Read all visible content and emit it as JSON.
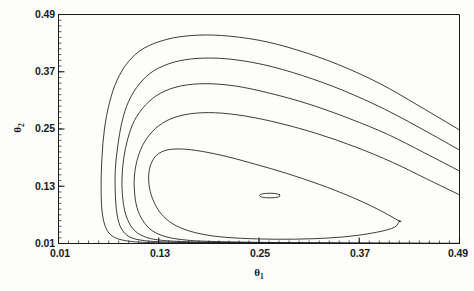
{
  "figure": {
    "type": "contour-plot",
    "background_color": "#fdfdfc",
    "line_color": "#1a1a1a",
    "axis_color": "#1a1a1a"
  },
  "axes": {
    "x": {
      "title_base": "θ",
      "title_sub": "1",
      "ticks": [
        "0.01",
        "0.13",
        "0.25",
        "0.37",
        "0.49"
      ],
      "min": 0.01,
      "max": 0.49
    },
    "y": {
      "title_base": "θ",
      "title_sub": "2",
      "ticks": [
        "0.01",
        "0.13",
        "0.25",
        "0.37",
        "0.49"
      ],
      "min": 0.01,
      "max": 0.49
    }
  },
  "chart_data": {
    "type": "line",
    "title": "",
    "xlabel": "θ₁",
    "ylabel": "θ₂",
    "xlim": [
      0.01,
      0.49
    ],
    "ylim": [
      0.01,
      0.49
    ],
    "xticks": [
      0.01,
      0.13,
      0.25,
      0.37,
      0.49
    ],
    "yticks": [
      0.01,
      0.13,
      0.25,
      0.37,
      0.49
    ],
    "grid": false,
    "legend": "none",
    "maximum_point": [
      0.26,
      0.11
    ],
    "series": [
      {
        "name": "contour-level-1-outermost",
        "closed": false,
        "points": [
          [
            0.49,
            0.248
          ],
          [
            0.44,
            0.3
          ],
          [
            0.395,
            0.345
          ],
          [
            0.345,
            0.385
          ],
          [
            0.295,
            0.416
          ],
          [
            0.25,
            0.436
          ],
          [
            0.205,
            0.446
          ],
          [
            0.17,
            0.446
          ],
          [
            0.14,
            0.438
          ],
          [
            0.113,
            0.42
          ],
          [
            0.094,
            0.392
          ],
          [
            0.08,
            0.352
          ],
          [
            0.071,
            0.305
          ],
          [
            0.065,
            0.25
          ],
          [
            0.062,
            0.19
          ],
          [
            0.061,
            0.13
          ],
          [
            0.062,
            0.08
          ],
          [
            0.066,
            0.046
          ],
          [
            0.074,
            0.026
          ],
          [
            0.09,
            0.016
          ],
          [
            0.12,
            0.012
          ],
          [
            0.18,
            0.011
          ],
          [
            0.26,
            0.0105
          ],
          [
            0.35,
            0.0103
          ],
          [
            0.43,
            0.0102
          ],
          [
            0.49,
            0.0101
          ]
        ]
      },
      {
        "name": "contour-level-2",
        "closed": false,
        "points": [
          [
            0.49,
            0.206
          ],
          [
            0.445,
            0.25
          ],
          [
            0.4,
            0.292
          ],
          [
            0.352,
            0.33
          ],
          [
            0.302,
            0.362
          ],
          [
            0.255,
            0.385
          ],
          [
            0.212,
            0.397
          ],
          [
            0.177,
            0.398
          ],
          [
            0.148,
            0.39
          ],
          [
            0.124,
            0.372
          ],
          [
            0.107,
            0.345
          ],
          [
            0.094,
            0.308
          ],
          [
            0.086,
            0.265
          ],
          [
            0.081,
            0.215
          ],
          [
            0.078,
            0.165
          ],
          [
            0.078,
            0.115
          ],
          [
            0.08,
            0.072
          ],
          [
            0.085,
            0.042
          ],
          [
            0.095,
            0.024
          ],
          [
            0.113,
            0.016
          ],
          [
            0.145,
            0.0128
          ],
          [
            0.2,
            0.0115
          ],
          [
            0.28,
            0.0108
          ],
          [
            0.37,
            0.0104
          ],
          [
            0.44,
            0.0102
          ],
          [
            0.49,
            0.0101
          ]
        ]
      },
      {
        "name": "contour-level-3",
        "closed": false,
        "points": [
          [
            0.49,
            0.162
          ],
          [
            0.448,
            0.2
          ],
          [
            0.405,
            0.238
          ],
          [
            0.358,
            0.272
          ],
          [
            0.31,
            0.302
          ],
          [
            0.263,
            0.325
          ],
          [
            0.222,
            0.34
          ],
          [
            0.186,
            0.345
          ],
          [
            0.156,
            0.34
          ],
          [
            0.132,
            0.325
          ],
          [
            0.114,
            0.3
          ],
          [
            0.101,
            0.268
          ],
          [
            0.093,
            0.23
          ],
          [
            0.088,
            0.188
          ],
          [
            0.086,
            0.145
          ],
          [
            0.087,
            0.103
          ],
          [
            0.091,
            0.068
          ],
          [
            0.099,
            0.041
          ],
          [
            0.112,
            0.025
          ],
          [
            0.132,
            0.017
          ],
          [
            0.168,
            0.0135
          ],
          [
            0.225,
            0.0118
          ],
          [
            0.305,
            0.0109
          ],
          [
            0.39,
            0.0104
          ],
          [
            0.45,
            0.0102
          ],
          [
            0.49,
            0.0101
          ]
        ]
      },
      {
        "name": "contour-level-4",
        "closed": false,
        "points": [
          [
            0.49,
            0.112
          ],
          [
            0.45,
            0.146
          ],
          [
            0.41,
            0.18
          ],
          [
            0.366,
            0.212
          ],
          [
            0.32,
            0.24
          ],
          [
            0.275,
            0.262
          ],
          [
            0.234,
            0.277
          ],
          [
            0.198,
            0.284
          ],
          [
            0.168,
            0.282
          ],
          [
            0.144,
            0.271
          ],
          [
            0.126,
            0.251
          ],
          [
            0.113,
            0.223
          ],
          [
            0.105,
            0.19
          ],
          [
            0.101,
            0.154
          ],
          [
            0.101,
            0.118
          ],
          [
            0.104,
            0.085
          ],
          [
            0.111,
            0.058
          ],
          [
            0.122,
            0.037
          ],
          [
            0.139,
            0.024
          ],
          [
            0.164,
            0.017
          ],
          [
            0.2,
            0.014
          ],
          [
            0.26,
            0.0122
          ],
          [
            0.34,
            0.0111
          ],
          [
            0.415,
            0.0105
          ],
          [
            0.465,
            0.0102
          ],
          [
            0.49,
            0.0101
          ]
        ]
      },
      {
        "name": "contour-level-5",
        "closed": true,
        "points": [
          [
            0.418,
            0.057
          ],
          [
            0.392,
            0.082
          ],
          [
            0.36,
            0.108
          ],
          [
            0.322,
            0.134
          ],
          [
            0.283,
            0.157
          ],
          [
            0.246,
            0.176
          ],
          [
            0.212,
            0.192
          ],
          [
            0.182,
            0.203
          ],
          [
            0.158,
            0.208
          ],
          [
            0.14,
            0.206
          ],
          [
            0.128,
            0.196
          ],
          [
            0.121,
            0.178
          ],
          [
            0.118,
            0.154
          ],
          [
            0.119,
            0.126
          ],
          [
            0.124,
            0.098
          ],
          [
            0.133,
            0.072
          ],
          [
            0.147,
            0.051
          ],
          [
            0.167,
            0.036
          ],
          [
            0.194,
            0.026
          ],
          [
            0.228,
            0.021
          ],
          [
            0.27,
            0.019
          ],
          [
            0.315,
            0.02
          ],
          [
            0.358,
            0.025
          ],
          [
            0.392,
            0.034
          ],
          [
            0.412,
            0.044
          ],
          [
            0.418,
            0.057
          ]
        ]
      },
      {
        "name": "contour-level-6-innermost",
        "closed": true,
        "points": [
          [
            0.2745,
            0.1125
          ],
          [
            0.268,
            0.115
          ],
          [
            0.258,
            0.115
          ],
          [
            0.2515,
            0.1125
          ],
          [
            0.2515,
            0.1085
          ],
          [
            0.258,
            0.106
          ],
          [
            0.268,
            0.106
          ],
          [
            0.2745,
            0.1085
          ],
          [
            0.2745,
            0.1125
          ]
        ]
      }
    ]
  }
}
